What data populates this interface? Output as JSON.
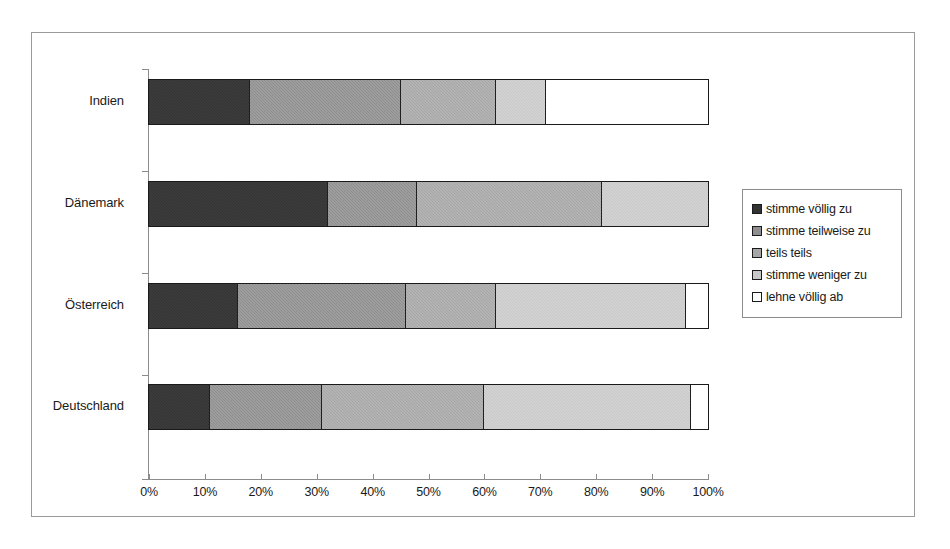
{
  "chart_data": {
    "type": "bar",
    "orientation": "horizontal",
    "stacked": true,
    "normalized": true,
    "title": "",
    "xlabel": "",
    "ylabel": "",
    "xlim": [
      0,
      100
    ],
    "grid": false,
    "legend_position": "right",
    "categories": [
      "Deutschland",
      "Österreich",
      "Dänemark",
      "Indien"
    ],
    "tick_labels": [
      "0%",
      "10%",
      "20%",
      "30%",
      "40%",
      "50%",
      "60%",
      "70%",
      "80%",
      "90%",
      "100%"
    ],
    "tick_values": [
      0,
      10,
      20,
      30,
      40,
      50,
      60,
      70,
      80,
      90,
      100
    ],
    "series": [
      {
        "name": "stimme völlig zu",
        "color": "#333333",
        "values": [
          11,
          16,
          32,
          18
        ]
      },
      {
        "name": "stimme teilweise zu",
        "color": "#8e8e8e",
        "values": [
          20,
          30,
          16,
          27
        ]
      },
      {
        "name": "teils teils",
        "color": "#a6a6a6",
        "values": [
          29,
          16,
          33,
          17
        ]
      },
      {
        "name": "stimme weniger zu",
        "color": "#c8c8c8",
        "values": [
          37,
          34,
          19,
          9
        ]
      },
      {
        "name": "lehne völlig ab",
        "color": "#ffffff",
        "values": [
          3,
          4,
          0,
          29
        ]
      }
    ],
    "rows": [
      {
        "category": "Indien",
        "segments": [
          {
            "label": "stimme völlig zu",
            "value": 18
          },
          {
            "label": "stimme teilweise zu",
            "value": 27
          },
          {
            "label": "teils teils",
            "value": 17
          },
          {
            "label": "stimme weniger zu",
            "value": 9
          },
          {
            "label": "lehne völlig ab",
            "value": 29
          }
        ]
      },
      {
        "category": "Dänemark",
        "segments": [
          {
            "label": "stimme völlig zu",
            "value": 32
          },
          {
            "label": "stimme teilweise zu",
            "value": 16
          },
          {
            "label": "teils teils",
            "value": 33
          },
          {
            "label": "stimme weniger zu",
            "value": 19
          },
          {
            "label": "lehne völlig ab",
            "value": 0
          }
        ]
      },
      {
        "category": "Österreich",
        "segments": [
          {
            "label": "stimme völlig zu",
            "value": 16
          },
          {
            "label": "stimme teilweise zu",
            "value": 30
          },
          {
            "label": "teils teils",
            "value": 16
          },
          {
            "label": "stimme weniger zu",
            "value": 34
          },
          {
            "label": "lehne völlig ab",
            "value": 4
          }
        ]
      },
      {
        "category": "Deutschland",
        "segments": [
          {
            "label": "stimme völlig zu",
            "value": 11
          },
          {
            "label": "stimme teilweise zu",
            "value": 20
          },
          {
            "label": "teils teils",
            "value": 29
          },
          {
            "label": "stimme weniger zu",
            "value": 37
          },
          {
            "label": "lehne völlig ab",
            "value": 3
          }
        ]
      }
    ]
  },
  "legend": {
    "items": [
      {
        "label": "stimme völlig zu"
      },
      {
        "label": "stimme teilweise zu"
      },
      {
        "label": "teils teils"
      },
      {
        "label": "stimme weniger zu"
      },
      {
        "label": "lehne völlig ab"
      }
    ]
  },
  "axis": {
    "x_labels": [
      "0%",
      "10%",
      "20%",
      "30%",
      "40%",
      "50%",
      "60%",
      "70%",
      "80%",
      "90%",
      "100%"
    ],
    "y_labels": [
      "Indien",
      "Dänemark",
      "Österreich",
      "Deutschland"
    ]
  }
}
